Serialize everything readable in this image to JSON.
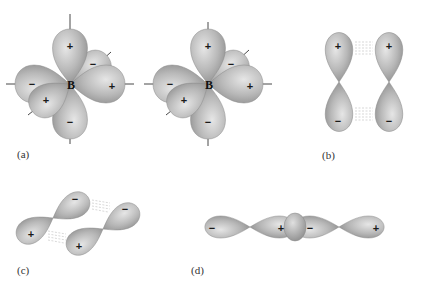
{
  "figure": {
    "colors": {
      "lobe_light": "#e4e4e4",
      "lobe_mid": "#b4b4b4",
      "lobe_dark": "#8c8c8c",
      "text": "#1a1a1a",
      "background": "#ffffff"
    },
    "panels": {
      "a": {
        "label": "(a)",
        "atom_left": "B",
        "atom_right": "B",
        "signs": {
          "top": "+",
          "bottom": "−",
          "left": "−",
          "right": "+",
          "back_upper": "−",
          "front_lower": "+"
        }
      },
      "b": {
        "label": "(b)",
        "signs": {
          "left_top": "+",
          "left_bottom": "−",
          "right_top": "+",
          "right_bottom": "−"
        }
      },
      "c": {
        "label": "(c)",
        "signs": {
          "left_lower": "+",
          "left_upper": "−",
          "right_lower": "+",
          "right_upper": "−"
        }
      },
      "d": {
        "label": "(d)",
        "signs": {
          "far_left": "−",
          "center_left": "+",
          "center_right": "−",
          "far_right": "+"
        }
      }
    }
  }
}
